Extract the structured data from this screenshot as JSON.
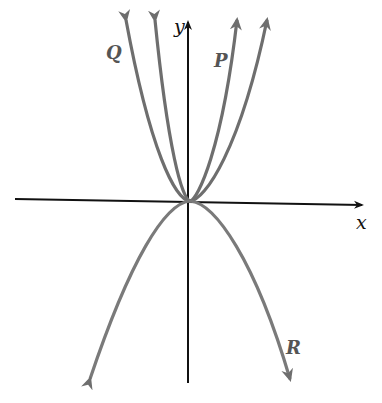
{
  "diagram": {
    "axes": {
      "x_label": "x",
      "y_label": "y"
    },
    "curves": [
      {
        "label": "Q",
        "direction": "up",
        "relative_width": "wide (outer-left branch pair)"
      },
      {
        "label": "",
        "direction": "up",
        "relative_width": "narrow"
      },
      {
        "label": "P",
        "direction": "up",
        "relative_width": "narrow"
      },
      {
        "label": "R",
        "direction": "down"
      }
    ],
    "colors": {
      "axes": "#111111",
      "curves": "#6e6e6e",
      "background": "#ffffff"
    }
  }
}
